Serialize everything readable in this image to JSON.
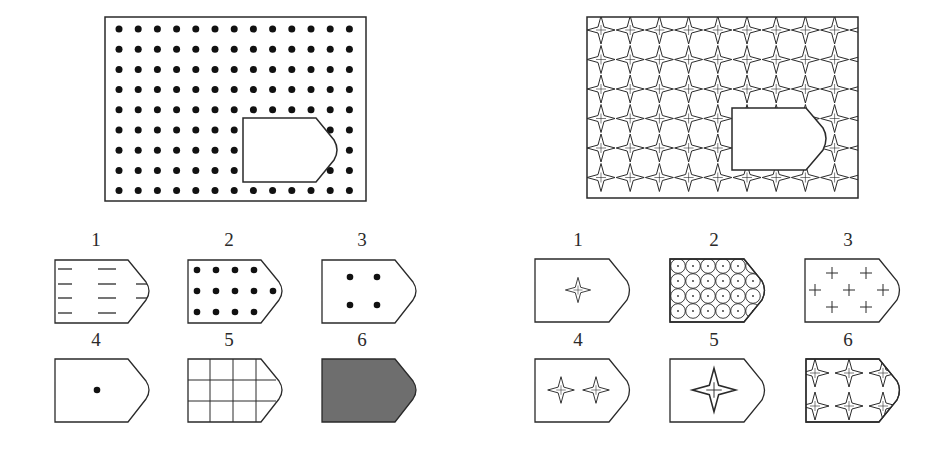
{
  "puzzles": [
    {
      "id": "left",
      "main": {
        "pattern": "dot-grid",
        "pattern_description": "13 x 9 grid of solid black dots with a missing pentagon-shaped piece",
        "dot_columns": 13,
        "dot_rows": 9
      },
      "options": [
        {
          "label": "1",
          "pattern": "horizontal-dashes"
        },
        {
          "label": "2",
          "pattern": "dense-dot-grid"
        },
        {
          "label": "3",
          "pattern": "four-dots"
        },
        {
          "label": "4",
          "pattern": "single-dot"
        },
        {
          "label": "5",
          "pattern": "square-grid"
        },
        {
          "label": "6",
          "pattern": "solid-gray"
        }
      ]
    },
    {
      "id": "right",
      "main": {
        "pattern": "star-lattice",
        "pattern_description": "lattice of four-pointed stars with a missing pentagon-shaped piece",
        "star_columns": 9,
        "star_rows": 6
      },
      "options": [
        {
          "label": "1",
          "pattern": "single-small-star"
        },
        {
          "label": "2",
          "pattern": "dotted-circles"
        },
        {
          "label": "3",
          "pattern": "plus-signs"
        },
        {
          "label": "4",
          "pattern": "two-small-stars"
        },
        {
          "label": "5",
          "pattern": "single-large-star"
        },
        {
          "label": "6",
          "pattern": "star-lattice"
        }
      ]
    }
  ],
  "colors": {
    "line": "#2a2a2a",
    "dot": "#111111",
    "fill_gray": "#6e6e6e",
    "background": "#ffffff"
  }
}
